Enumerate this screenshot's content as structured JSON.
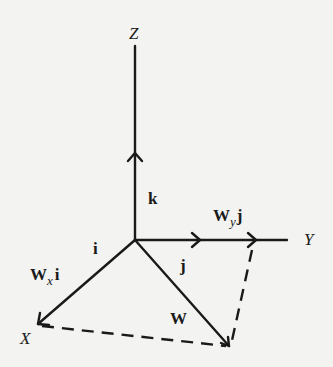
{
  "diagram": {
    "title": "",
    "axes": {
      "x_label": "X",
      "y_label": "Y",
      "z_label": "Z"
    },
    "unit_vectors": {
      "i": "i",
      "j": "j",
      "k": "k"
    },
    "components": {
      "wx_main": "W",
      "wx_sub": "x",
      "wx_vec": "i",
      "wy_main": "W",
      "wy_sub": "y",
      "wy_vec": "j"
    },
    "resultant": "W",
    "colors": {
      "line": "#1a1a1a",
      "background": "#f3f3f1"
    }
  }
}
